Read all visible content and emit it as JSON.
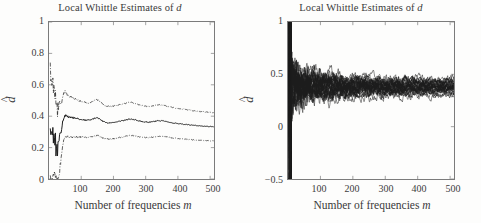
{
  "figure": {
    "background_color": "#fdfdfc",
    "axis_color": "#7b7b7b",
    "line_color": "#1c1c1c"
  },
  "panels": [
    {
      "id": "left",
      "title_prefix": "Local Whittle Estimates of ",
      "title_italic": "d",
      "xlabel_prefix": "Number of frequencies ",
      "xlabel_italic": "m",
      "ylabel_base": "d",
      "ylabel_hat": "̂",
      "yticks": [
        "0",
        "0.2",
        "0.4",
        "0.6",
        "0.8",
        "1"
      ],
      "xticks": [
        "100",
        "200",
        "300",
        "400",
        "500"
      ]
    },
    {
      "id": "right",
      "title_prefix": "Local Whittle Estimates of ",
      "title_italic": "d",
      "xlabel_prefix": "Number of frequencies ",
      "xlabel_italic": "m",
      "ylabel_base": "d",
      "ylabel_hat": "̂",
      "yticks": [
        "−0.5",
        "0",
        "0.5",
        "1"
      ],
      "xticks": [
        "100",
        "200",
        "300",
        "400",
        "500"
      ]
    }
  ],
  "chart_data": [
    {
      "type": "line",
      "panel": "left",
      "title": "Local Whittle Estimates of d",
      "xlabel": "Number of frequencies m",
      "ylabel": "d-hat",
      "xlim": [
        0,
        512
      ],
      "ylim": [
        0,
        1
      ],
      "xticks": [
        100,
        200,
        300,
        400,
        500
      ],
      "yticks": [
        0,
        0.2,
        0.4,
        0.6,
        0.8,
        1
      ],
      "grid": false,
      "legend": "none",
      "series": [
        {
          "name": "upper confidence band",
          "style": "dash-dot",
          "x": [
            4,
            6,
            8,
            10,
            12,
            14,
            16,
            18,
            20,
            22,
            24,
            26,
            28,
            30,
            34,
            38,
            42,
            46,
            50,
            55,
            60,
            70,
            80,
            90,
            100,
            110,
            120,
            130,
            140,
            150,
            160,
            170,
            180,
            190,
            200,
            215,
            230,
            245,
            255,
            265,
            280,
            295,
            310,
            325,
            340,
            355,
            370,
            385,
            400,
            420,
            440,
            460,
            480,
            500,
            512
          ],
          "values": [
            0.72,
            0.62,
            0.66,
            0.58,
            0.63,
            0.55,
            0.61,
            0.5,
            0.56,
            0.44,
            0.53,
            0.4,
            0.49,
            0.45,
            0.5,
            0.47,
            0.52,
            0.55,
            0.56,
            0.54,
            0.53,
            0.52,
            0.51,
            0.5,
            0.495,
            0.49,
            0.485,
            0.49,
            0.5,
            0.505,
            0.49,
            0.47,
            0.465,
            0.462,
            0.465,
            0.472,
            0.478,
            0.485,
            0.488,
            0.483,
            0.472,
            0.465,
            0.462,
            0.466,
            0.473,
            0.47,
            0.462,
            0.455,
            0.45,
            0.444,
            0.438,
            0.432,
            0.428,
            0.424,
            0.422
          ]
        },
        {
          "name": "point estimate",
          "style": "solid",
          "x": [
            4,
            6,
            8,
            10,
            12,
            14,
            16,
            18,
            20,
            22,
            24,
            26,
            28,
            30,
            34,
            38,
            42,
            46,
            50,
            55,
            60,
            70,
            80,
            90,
            100,
            110,
            120,
            130,
            140,
            150,
            160,
            170,
            180,
            190,
            200,
            215,
            230,
            245,
            255,
            265,
            280,
            295,
            310,
            325,
            340,
            355,
            370,
            385,
            400,
            420,
            440,
            460,
            480,
            500,
            512
          ],
          "values": [
            0.3,
            0.26,
            0.34,
            0.22,
            0.33,
            0.2,
            0.31,
            0.18,
            0.29,
            0.14,
            0.27,
            0.11,
            0.24,
            0.21,
            0.28,
            0.3,
            0.36,
            0.39,
            0.405,
            0.4,
            0.395,
            0.392,
            0.388,
            0.383,
            0.38,
            0.377,
            0.374,
            0.378,
            0.386,
            0.39,
            0.378,
            0.363,
            0.359,
            0.357,
            0.36,
            0.366,
            0.372,
            0.379,
            0.382,
            0.378,
            0.369,
            0.364,
            0.362,
            0.366,
            0.372,
            0.37,
            0.363,
            0.357,
            0.353,
            0.348,
            0.344,
            0.34,
            0.337,
            0.334,
            0.333
          ]
        },
        {
          "name": "lower confidence band",
          "style": "dash-dot",
          "x": [
            4,
            6,
            8,
            10,
            12,
            14,
            16,
            18,
            20,
            22,
            24,
            26,
            28,
            30,
            34,
            38,
            42,
            46,
            50,
            55,
            60,
            70,
            80,
            90,
            100,
            110,
            120,
            130,
            140,
            150,
            160,
            170,
            180,
            190,
            200,
            215,
            230,
            245,
            255,
            265,
            280,
            295,
            310,
            325,
            340,
            355,
            370,
            385,
            400,
            420,
            440,
            460,
            480,
            500,
            512
          ],
          "values": [
            0.0,
            0.0,
            0.03,
            0.0,
            0.04,
            0.0,
            0.02,
            0.0,
            0.03,
            0.0,
            0.02,
            0.0,
            0.0,
            0.0,
            0.06,
            0.14,
            0.21,
            0.25,
            0.27,
            0.27,
            0.268,
            0.266,
            0.268,
            0.268,
            0.267,
            0.266,
            0.265,
            0.268,
            0.275,
            0.278,
            0.269,
            0.258,
            0.256,
            0.254,
            0.257,
            0.262,
            0.268,
            0.275,
            0.278,
            0.275,
            0.268,
            0.264,
            0.263,
            0.268,
            0.273,
            0.271,
            0.266,
            0.261,
            0.258,
            0.254,
            0.251,
            0.248,
            0.246,
            0.244,
            0.243
          ]
        }
      ]
    },
    {
      "type": "line",
      "panel": "right",
      "title": "Local Whittle Estimates of d",
      "xlabel": "Number of frequencies m",
      "ylabel": "d-hat",
      "xlim": [
        0,
        512
      ],
      "ylim": [
        -0.5,
        1
      ],
      "xticks": [
        100,
        200,
        300,
        400,
        500
      ],
      "yticks": [
        -0.5,
        0,
        0.5,
        1
      ],
      "grid": false,
      "legend": "none",
      "description": "Ensemble of 30 Monte-Carlo replication paths of the local Whittle estimator; highly dispersed (spanning the full -0.5 to 1 range) for small m, converging to a tight band around 0.33-0.45 as m grows toward 500.",
      "n_replications": 30,
      "converged_band": [
        0.3,
        0.46
      ],
      "converged_center": 0.38
    }
  ]
}
